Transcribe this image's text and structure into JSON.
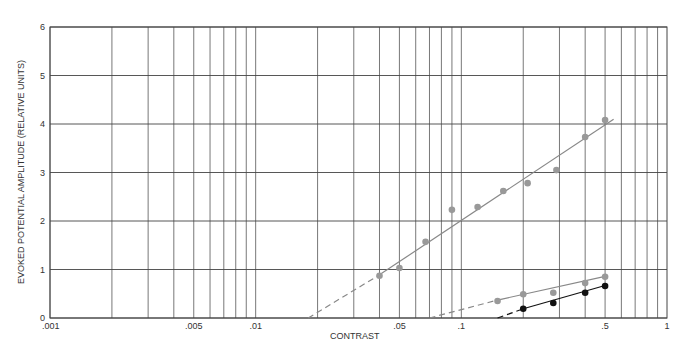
{
  "chart_data": {
    "type": "scatter",
    "title": "",
    "xlabel": "CONTRAST",
    "ylabel": "EVOKED POTENTIAL AMPLITUDE (RELATIVE UNITS)",
    "xscale": "log",
    "xlim": [
      0.001,
      1
    ],
    "ylim": [
      0,
      6
    ],
    "grid": true,
    "legend": "none",
    "x_tick_labels": [
      {
        "value": 0.001,
        "label": ".001"
      },
      {
        "value": 0.005,
        "label": ".005"
      },
      {
        "value": 0.01,
        "label": ".01"
      },
      {
        "value": 0.05,
        "label": ".05"
      },
      {
        "value": 0.1,
        "label": ".1"
      },
      {
        "value": 0.5,
        "label": ".5"
      },
      {
        "value": 1,
        "label": "1"
      }
    ],
    "y_tick_labels": [
      {
        "value": 0,
        "label": "0"
      },
      {
        "value": 1,
        "label": "1"
      },
      {
        "value": 2,
        "label": "2"
      },
      {
        "value": 3,
        "label": "3"
      },
      {
        "value": 4,
        "label": "4"
      },
      {
        "value": 5,
        "label": "5"
      },
      {
        "value": 6,
        "label": "6"
      }
    ],
    "series": [
      {
        "name": "upper (gray)",
        "color": "#999999",
        "line_color": "#888888",
        "points": [
          {
            "x": 0.04,
            "y": 0.87
          },
          {
            "x": 0.05,
            "y": 1.03
          },
          {
            "x": 0.067,
            "y": 1.57
          },
          {
            "x": 0.09,
            "y": 2.23
          },
          {
            "x": 0.12,
            "y": 2.29
          },
          {
            "x": 0.16,
            "y": 2.62
          },
          {
            "x": 0.21,
            "y": 2.78
          },
          {
            "x": 0.29,
            "y": 3.05
          },
          {
            "x": 0.4,
            "y": 3.73
          },
          {
            "x": 0.5,
            "y": 4.08
          }
        ],
        "fit_solid": {
          "x0": 0.04,
          "y0": 0.89,
          "x1": 0.55,
          "y1": 4.1
        },
        "fit_dashed": {
          "x0": 0.018,
          "y0": 0,
          "x1": 0.04,
          "y1": 0.89
        }
      },
      {
        "name": "middle (gray)",
        "color": "#999999",
        "line_color": "#888888",
        "points": [
          {
            "x": 0.15,
            "y": 0.35
          },
          {
            "x": 0.2,
            "y": 0.49
          },
          {
            "x": 0.28,
            "y": 0.52
          },
          {
            "x": 0.4,
            "y": 0.72
          },
          {
            "x": 0.5,
            "y": 0.85
          }
        ],
        "fit_solid": {
          "x0": 0.15,
          "y0": 0.37,
          "x1": 0.5,
          "y1": 0.86
        },
        "fit_dashed": {
          "x0": 0.07,
          "y0": 0,
          "x1": 0.15,
          "y1": 0.37
        }
      },
      {
        "name": "lower (black)",
        "color": "#111111",
        "line_color": "#111111",
        "points": [
          {
            "x": 0.2,
            "y": 0.19
          },
          {
            "x": 0.28,
            "y": 0.31
          },
          {
            "x": 0.4,
            "y": 0.52
          },
          {
            "x": 0.5,
            "y": 0.66
          }
        ],
        "fit_solid": {
          "x0": 0.2,
          "y0": 0.19,
          "x1": 0.5,
          "y1": 0.67
        },
        "fit_dashed": {
          "x0": 0.15,
          "y0": 0,
          "x1": 0.2,
          "y1": 0.19
        }
      }
    ]
  }
}
